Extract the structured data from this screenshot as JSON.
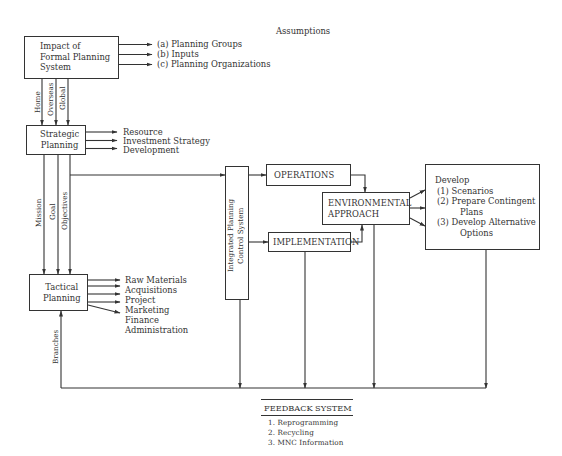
{
  "diagram": {
    "assumptions_label": "Assumptions",
    "impact_box": {
      "lines": [
        "Impact of",
        "Formal Planning",
        "System"
      ],
      "outputs": [
        "(a)  Planning Groups",
        "(b)  Inputs",
        "(c)  Planning Organizations"
      ],
      "flows": [
        "Home",
        "Overseas",
        "Global"
      ]
    },
    "strategic_box": {
      "lines": [
        "Strategic",
        "Planning"
      ],
      "outputs": [
        "Resource",
        "Investment Strategy",
        "Development"
      ],
      "flows": [
        "Mission",
        "Goal",
        "Objectives"
      ]
    },
    "tactical_box": {
      "lines": [
        "Tactical",
        "Planning"
      ],
      "outputs": [
        "Raw Materials",
        "Acquisitions",
        "Project",
        "Marketing",
        "Finance",
        "Administration"
      ],
      "input_flow": "Branches"
    },
    "integrated_box": {
      "lines": [
        "Integrated  Planning",
        "Control  System"
      ]
    },
    "operations_box": {
      "label": "OPERATIONS"
    },
    "implementation_box": {
      "label": "IMPLEMENTATION"
    },
    "environmental_box": {
      "lines": [
        "ENVIRONMENTAL",
        "APPROACH"
      ]
    },
    "develop_box": {
      "title": "Develop",
      "items": [
        "(1)  Scenarios",
        "(2)  Prepare Contingent",
        "Plans",
        "(3)  Develop Alternative",
        "Options"
      ]
    },
    "feedback": {
      "title": "FEEDBACK SYSTEM",
      "items": [
        "1.  Reprogramming",
        "2.  Recycling",
        "3.  MNC Information"
      ]
    },
    "colors": {
      "line": "#333333",
      "background": "#ffffff"
    }
  }
}
